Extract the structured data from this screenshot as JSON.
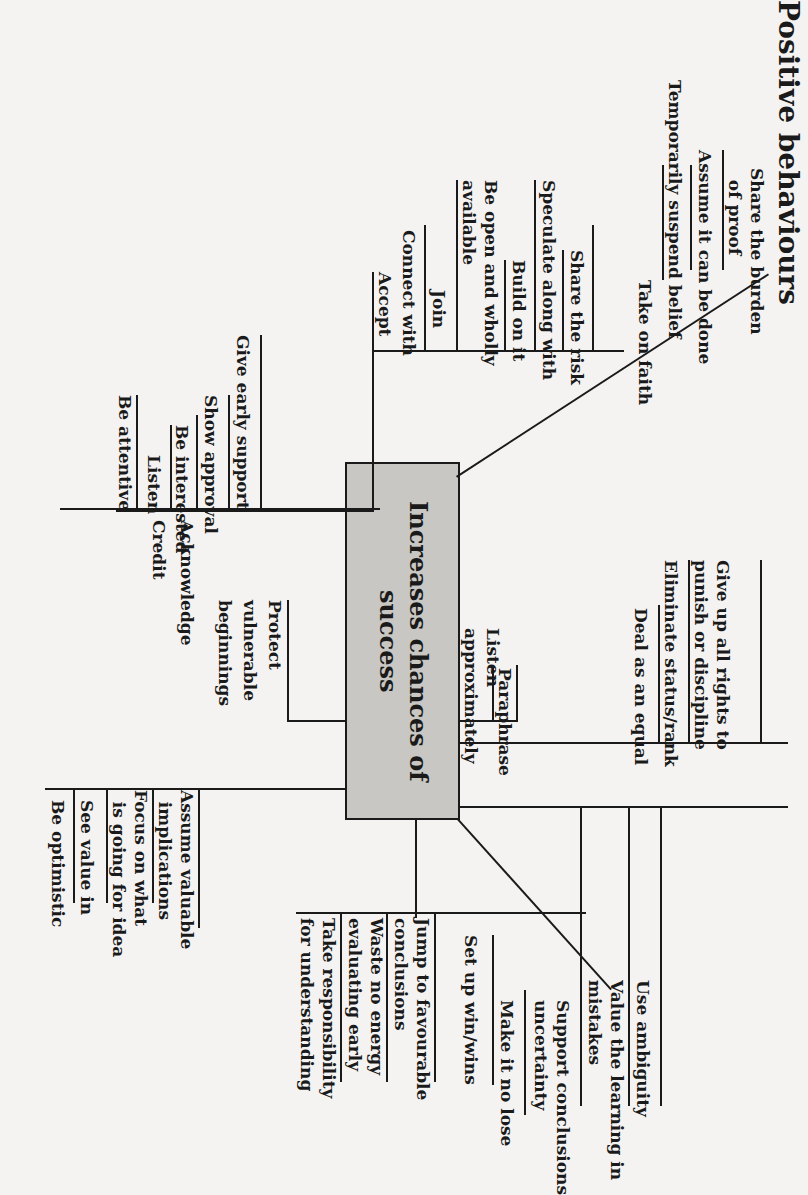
{
  "title": "Positive behaviours",
  "center": "Increases chances of success",
  "groups": {
    "acknowledge": {
      "label": "Acknowledge",
      "items": [
        "Be attentive",
        "Listen",
        "Be interested"
      ]
    },
    "credit": {
      "label": "Credit",
      "items": [
        "Show approval",
        "Give early support"
      ]
    },
    "accept": {
      "label": "Accept",
      "items": [
        "Connect with",
        "Join",
        "Be open and wholly\navailable",
        "Build on it",
        "Speculate along with",
        "Share the risk"
      ]
    },
    "faith": {
      "items": [
        "Take on faith",
        "Temporarily suspend belief",
        "Assume it can be done",
        "Share the burden\n  of proof"
      ]
    },
    "protect": {
      "label": "Protect\nvulnerable\nbeginnings"
    },
    "listen_approx": {
      "items": [
        "Listen\napproximately",
        "Paraphrase"
      ]
    },
    "optimistic": {
      "items": [
        "Be optimistic",
        "See value in",
        "Focus on what\n  is going for idea",
        "Assume valuable\n  implications"
      ]
    },
    "equal": {
      "items": [
        "Deal as an equal",
        "Eliminate status/rank",
        "Give up all rights to\npunish or discipline"
      ]
    },
    "responsibility": {
      "items": [
        "Take responsibility\nfor understanding",
        "Waste no energy\nevaluating early",
        "Jump to favourable\nconclusions"
      ]
    },
    "win": {
      "items": [
        "Set up win/wins",
        "Make it no lose"
      ]
    },
    "uncertainty": {
      "items": [
        "Support conclusions\nuncertainty",
        "Value the learning in\nmistakes",
        "Use ambiguity"
      ]
    }
  }
}
